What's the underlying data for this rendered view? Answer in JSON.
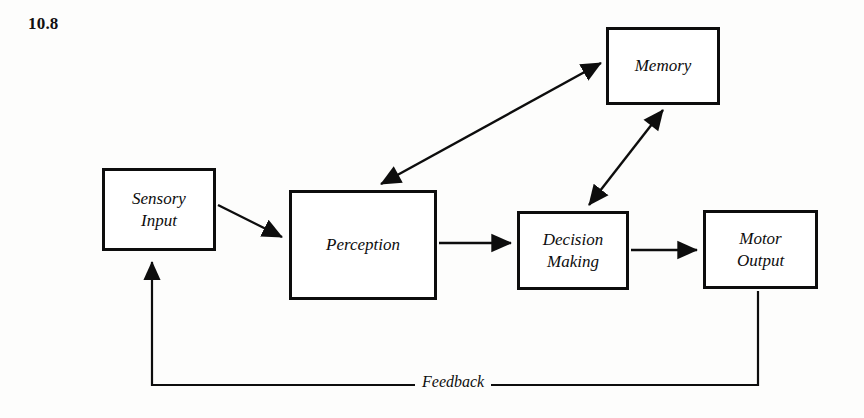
{
  "figure": {
    "number": "10.8",
    "background_color": "#fdfdfc",
    "ink_color": "#0d0d0d"
  },
  "nodes": [
    {
      "id": "sensory-input",
      "label": "Sensory\nInput",
      "x": 102,
      "y": 168,
      "w": 114,
      "h": 83
    },
    {
      "id": "perception",
      "label": "Perception",
      "x": 289,
      "y": 190,
      "w": 148,
      "h": 110
    },
    {
      "id": "memory",
      "label": "Memory",
      "x": 606,
      "y": 27,
      "w": 114,
      "h": 78
    },
    {
      "id": "decision-making",
      "label": "Decision\nMaking",
      "x": 517,
      "y": 211,
      "w": 112,
      "h": 79
    },
    {
      "id": "motor-output",
      "label": "Motor\nOutput",
      "x": 703,
      "y": 210,
      "w": 115,
      "h": 79
    }
  ],
  "edges": [
    {
      "id": "sensory-to-perception",
      "from": "sensory-input",
      "to": "perception",
      "arrows": "single"
    },
    {
      "id": "perception-to-memory",
      "from": "perception",
      "to": "memory",
      "arrows": "double"
    },
    {
      "id": "memory-to-decision",
      "from": "memory",
      "to": "decision-making",
      "arrows": "double"
    },
    {
      "id": "perception-to-decision",
      "from": "perception",
      "to": "decision-making",
      "arrows": "single"
    },
    {
      "id": "decision-to-motor",
      "from": "decision-making",
      "to": "motor-output",
      "arrows": "single"
    },
    {
      "id": "feedback-loop",
      "from": "motor-output",
      "to": "sensory-input",
      "arrows": "single",
      "label": "Feedback"
    }
  ],
  "edge_labels": {
    "feedback": "Feedback"
  }
}
